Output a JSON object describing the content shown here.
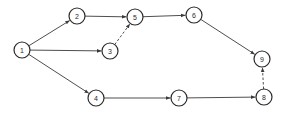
{
  "diagram": {
    "type": "activity-network",
    "nodes": [
      {
        "id": "1",
        "label": "1"
      },
      {
        "id": "2",
        "label": "2"
      },
      {
        "id": "3",
        "label": "3"
      },
      {
        "id": "4",
        "label": "4"
      },
      {
        "id": "5",
        "label": "5"
      },
      {
        "id": "6",
        "label": "6"
      },
      {
        "id": "7",
        "label": "7"
      },
      {
        "id": "8",
        "label": "8"
      },
      {
        "id": "9",
        "label": "9"
      }
    ],
    "edges": [
      {
        "from": "1",
        "to": "2",
        "style": "solid"
      },
      {
        "from": "2",
        "to": "5",
        "style": "solid"
      },
      {
        "from": "1",
        "to": "3",
        "style": "solid"
      },
      {
        "from": "3",
        "to": "5",
        "style": "dashed"
      },
      {
        "from": "5",
        "to": "6",
        "style": "solid"
      },
      {
        "from": "6",
        "to": "9",
        "style": "solid"
      },
      {
        "from": "1",
        "to": "4",
        "style": "solid"
      },
      {
        "from": "4",
        "to": "7",
        "style": "solid"
      },
      {
        "from": "7",
        "to": "8",
        "style": "solid"
      },
      {
        "from": "8",
        "to": "9",
        "style": "dashed"
      }
    ]
  }
}
